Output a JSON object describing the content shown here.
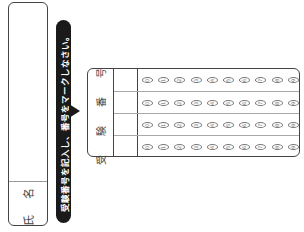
{
  "name_box": {
    "label": "氏 名"
  },
  "instruction": {
    "text": "受験番号を記入し、番号をマークしなさい。"
  },
  "exam_number": {
    "label": "受 験 番 号",
    "digits": [
      "0",
      "1",
      "2",
      "3",
      "4",
      "5",
      "6",
      "7",
      "8",
      "9"
    ],
    "rows": 4
  },
  "colors": {
    "border": "#444444",
    "banner": "#1a1a1a",
    "bubble": "#777777"
  }
}
